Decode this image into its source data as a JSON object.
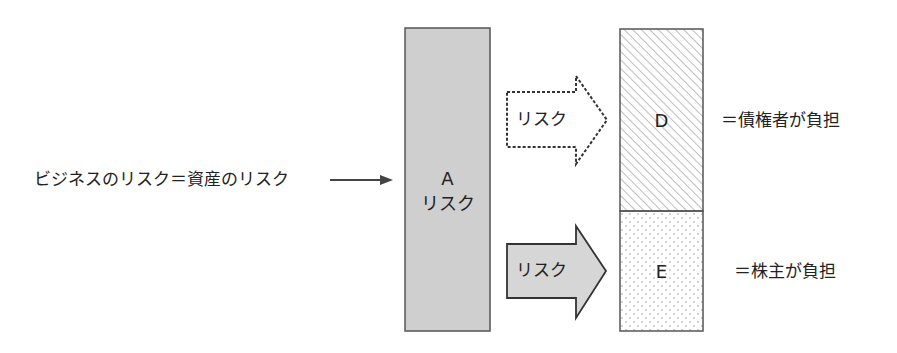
{
  "left_label": "ビジネスのリスク＝資産のリスク",
  "asset_box": {
    "letter": "A",
    "text": "リスク",
    "fill": "#cfcfcf"
  },
  "debt_arrow": {
    "text": "リスク",
    "style": "dashed"
  },
  "equity_arrow": {
    "text": "リスク",
    "style": "solid",
    "fill": "#d6d6d6"
  },
  "debt_box": {
    "letter": "D",
    "pattern": "diagonal-hatch",
    "caption": "＝債権者が負担"
  },
  "equity_box": {
    "letter": "E",
    "pattern": "dots",
    "caption": "＝株主が負担"
  },
  "colors": {
    "stroke": "#555555",
    "text": "#222222",
    "hatch": "#9a9a9a",
    "dots": "#9a9a9a"
  }
}
